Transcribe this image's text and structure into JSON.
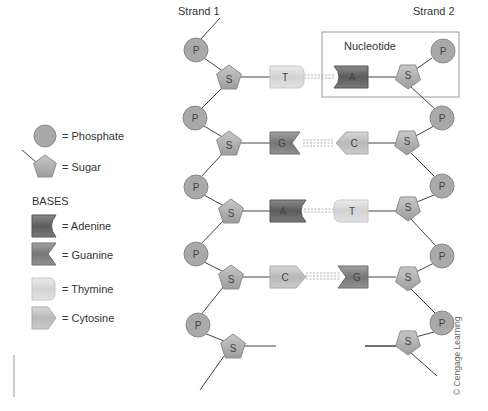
{
  "diagram": {
    "strand_labels": {
      "strand1": "Strand 1",
      "strand2": "Strand 2"
    },
    "nucleotide_box_label": "Nucleotide",
    "credit": "© Cengage Learning",
    "legend": {
      "phosphate": "= Phosphate",
      "sugar": "= Sugar",
      "bases_heading": "BASES",
      "adenine": "= Adenine",
      "guanine": "= Guanine",
      "thymine": "= Thymine",
      "cytosine": "= Cytosine"
    },
    "symbols": {
      "phosphate": "P",
      "sugar": "S"
    },
    "base_pairs": [
      {
        "left": "T",
        "right": "A"
      },
      {
        "left": "G",
        "right": "C"
      },
      {
        "left": "A",
        "right": "T"
      },
      {
        "left": "C",
        "right": "G"
      }
    ],
    "colors": {
      "phosphate": "#a9a9a9",
      "sugar": "#b8b8b8",
      "adenine": "#6f6f6f",
      "guanine": "#8a8a8a",
      "thymine": "#dcdcdc",
      "cytosine": "#c4c4c4",
      "box": "#999999"
    }
  }
}
